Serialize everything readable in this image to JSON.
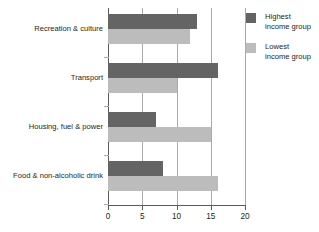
{
  "chart_data": {
    "type": "bar",
    "orientation": "horizontal",
    "title": "",
    "subtitle": "",
    "xlabel": "",
    "ylabel": "",
    "xlim": [
      0,
      20
    ],
    "xticks": [
      0,
      5,
      10,
      15,
      20
    ],
    "xtick_labels": [
      "0",
      "5",
      "10",
      "15",
      "20"
    ],
    "grid": "vertical",
    "legend_position": "right-top",
    "categories": [
      "Recreation & culture",
      "Transport",
      "Housing, fuel & power",
      "Food & non-alcoholic drink"
    ],
    "series": [
      {
        "name": "Highest income group",
        "color": "#646464",
        "values": [
          13,
          16,
          7,
          8
        ]
      },
      {
        "name": "Lowest income group",
        "color": "#bcbcbc",
        "values": [
          12,
          10,
          15,
          16
        ]
      }
    ]
  },
  "legend": {
    "items": [
      {
        "line1": "Highest",
        "line2": "income group",
        "color": "#646464"
      },
      {
        "line1": "Lowest",
        "line2": "income group",
        "color": "#bcbcbc"
      }
    ]
  },
  "axis": {
    "tick_labels": [
      "0",
      "5",
      "10",
      "15",
      "20"
    ]
  },
  "colors": {
    "highest": "#646464",
    "lowest": "#bcbcbc",
    "axis": "#58595b",
    "grid": "#a7a9ac",
    "text": "#231f20",
    "background": "#ffffff"
  }
}
